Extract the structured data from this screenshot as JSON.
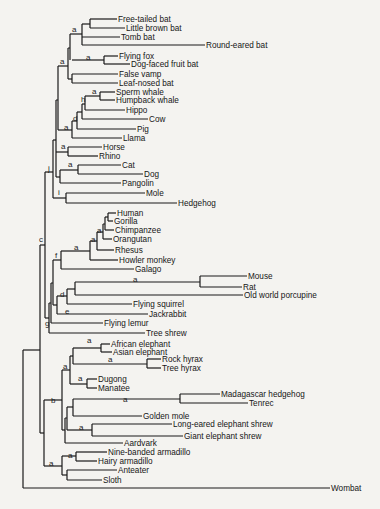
{
  "figure": {
    "type": "phylogenetic-tree",
    "stroke_color": "#1a1a1a",
    "background": "#f4f3f0",
    "leaves": [
      {
        "name": "Free-tailed bat",
        "x": 117,
        "y": 20
      },
      {
        "name": "Little brown bat",
        "x": 125,
        "y": 29
      },
      {
        "name": "Tomb bat",
        "x": 120,
        "y": 38
      },
      {
        "name": "Round-eared bat",
        "x": 205,
        "y": 46
      },
      {
        "name": "Flying fox",
        "x": 118,
        "y": 57
      },
      {
        "name": "Dog-faced fruit bat",
        "x": 130,
        "y": 65
      },
      {
        "name": "False vamp",
        "x": 118,
        "y": 75
      },
      {
        "name": "Leaf-nosed bat",
        "x": 118,
        "y": 84
      },
      {
        "name": "Sperm whale",
        "x": 115,
        "y": 93
      },
      {
        "name": "Humpback whale",
        "x": 115,
        "y": 101
      },
      {
        "name": "Hippo",
        "x": 125,
        "y": 111
      },
      {
        "name": "Cow",
        "x": 148,
        "y": 120
      },
      {
        "name": "Pig",
        "x": 136,
        "y": 130
      },
      {
        "name": "Llama",
        "x": 122,
        "y": 139
      },
      {
        "name": "Horse",
        "x": 102,
        "y": 148
      },
      {
        "name": "Rhino",
        "x": 98,
        "y": 157
      },
      {
        "name": "Cat",
        "x": 121,
        "y": 166
      },
      {
        "name": "Dog",
        "x": 143,
        "y": 175
      },
      {
        "name": "Pangolin",
        "x": 121,
        "y": 184
      },
      {
        "name": "Mole",
        "x": 145,
        "y": 194
      },
      {
        "name": "Hedgehog",
        "x": 177,
        "y": 204
      },
      {
        "name": "Human",
        "x": 116,
        "y": 214
      },
      {
        "name": "Gorilla",
        "x": 113,
        "y": 222
      },
      {
        "name": "Chimpanzee",
        "x": 114,
        "y": 231
      },
      {
        "name": "Orangutan",
        "x": 112,
        "y": 240
      },
      {
        "name": "Rhesus",
        "x": 114,
        "y": 251
      },
      {
        "name": "Howler monkey",
        "x": 118,
        "y": 261
      },
      {
        "name": "Galago",
        "x": 134,
        "y": 270
      },
      {
        "name": "Mouse",
        "x": 247,
        "y": 277
      },
      {
        "name": "Rat",
        "x": 242,
        "y": 288
      },
      {
        "name": "Old world porcupine",
        "x": 243,
        "y": 296
      },
      {
        "name": "Flying squirrel",
        "x": 132,
        "y": 305
      },
      {
        "name": "Jackrabbit",
        "x": 148,
        "y": 315
      },
      {
        "name": "Flying lemur",
        "x": 103,
        "y": 324
      },
      {
        "name": "Tree shrew",
        "x": 145,
        "y": 334
      },
      {
        "name": "African elephant",
        "x": 110,
        "y": 345
      },
      {
        "name": "Asian elephant",
        "x": 112,
        "y": 353
      },
      {
        "name": "Rock hyrax",
        "x": 161,
        "y": 360
      },
      {
        "name": "Tree hyrax",
        "x": 161,
        "y": 369
      },
      {
        "name": "Dugong",
        "x": 97,
        "y": 380
      },
      {
        "name": "Manatee",
        "x": 97,
        "y": 389
      },
      {
        "name": "Madagascar hedgehog",
        "x": 220,
        "y": 395
      },
      {
        "name": "Tenrec",
        "x": 248,
        "y": 404
      },
      {
        "name": "Golden mole",
        "x": 142,
        "y": 417
      },
      {
        "name": "Long-eared elephant shrew",
        "x": 172,
        "y": 425
      },
      {
        "name": "Giant elephant shrew",
        "x": 183,
        "y": 437
      },
      {
        "name": "Aardvark",
        "x": 123,
        "y": 444
      },
      {
        "name": "Nine-banded armadillo",
        "x": 107,
        "y": 453
      },
      {
        "name": "Hairy armadillo",
        "x": 97,
        "y": 462
      },
      {
        "name": "Anteater",
        "x": 117,
        "y": 471
      },
      {
        "name": "Sloth",
        "x": 102,
        "y": 481
      },
      {
        "name": "Wombat",
        "x": 330,
        "y": 489
      }
    ],
    "node_labels": [
      {
        "text": "a",
        "x": 72,
        "y": 32
      },
      {
        "text": "a",
        "x": 60,
        "y": 64
      },
      {
        "text": "a",
        "x": 86,
        "y": 60
      },
      {
        "text": "a",
        "x": 92,
        "y": 94
      },
      {
        "text": "h",
        "x": 81,
        "y": 102
      },
      {
        "text": "d",
        "x": 73,
        "y": 121
      },
      {
        "text": "a",
        "x": 64,
        "y": 130
      },
      {
        "text": "a",
        "x": 61,
        "y": 149
      },
      {
        "text": "a",
        "x": 68,
        "y": 167
      },
      {
        "text": "j",
        "x": 48,
        "y": 171
      },
      {
        "text": "i",
        "x": 58,
        "y": 195
      },
      {
        "text": "a",
        "x": 97,
        "y": 233
      },
      {
        "text": "a",
        "x": 91,
        "y": 242
      },
      {
        "text": "a",
        "x": 74,
        "y": 250
      },
      {
        "text": "c",
        "x": 39,
        "y": 242
      },
      {
        "text": "f",
        "x": 55,
        "y": 258
      },
      {
        "text": "a",
        "x": 133,
        "y": 282
      },
      {
        "text": "d",
        "x": 60,
        "y": 297
      },
      {
        "text": "e",
        "x": 65,
        "y": 314
      },
      {
        "text": "g",
        "x": 45,
        "y": 326
      },
      {
        "text": "a",
        "x": 87,
        "y": 343
      },
      {
        "text": "a",
        "x": 108,
        "y": 362
      },
      {
        "text": "a",
        "x": 63,
        "y": 369
      },
      {
        "text": "a",
        "x": 78,
        "y": 381
      },
      {
        "text": "b",
        "x": 51,
        "y": 403
      },
      {
        "text": "a",
        "x": 123,
        "y": 402
      },
      {
        "text": "a",
        "x": 79,
        "y": 430
      },
      {
        "text": "a",
        "x": 68,
        "y": 458
      },
      {
        "text": "a",
        "x": 49,
        "y": 466
      }
    ]
  }
}
